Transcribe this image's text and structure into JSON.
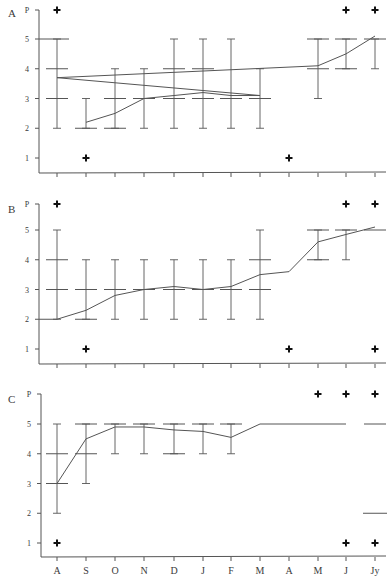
{
  "chart_data": [
    {
      "panel": "A",
      "type": "line",
      "title": "A",
      "ylabel": "",
      "xlabel": "",
      "y_tick_labels": [
        "1",
        "2",
        "3",
        "4",
        "5",
        "P"
      ],
      "categories": [
        "A",
        "S",
        "O",
        "N",
        "D",
        "J",
        "F",
        "M",
        "A",
        "M",
        "J",
        "Jy"
      ],
      "ylim": [
        0.5,
        6
      ],
      "mean_line": [
        {
          "x": "S",
          "y": 2.2
        },
        {
          "x": "O",
          "y": 2.5
        },
        {
          "x": "N",
          "y": 3.0
        },
        {
          "x": "D",
          "y": 3.1
        },
        {
          "x": "J",
          "y": 3.2
        },
        {
          "x": "F",
          "y": 3.1
        },
        {
          "x": "M",
          "y": 3.1
        },
        {
          "x": "A",
          "y": 3.7
        },
        {
          "x": "M",
          "y": 4.1
        },
        {
          "x": "J",
          "y": 4.5
        },
        {
          "x": "Jy",
          "y": 5.1
        }
      ],
      "error_bars": [
        {
          "x": "S",
          "low": 2,
          "high": 3
        },
        {
          "x": "O",
          "low": 2,
          "high": 4
        },
        {
          "x": "N",
          "low": 2,
          "high": 4
        },
        {
          "x": "D",
          "low": 2,
          "high": 5
        },
        {
          "x": "J",
          "low": 2,
          "high": 5
        },
        {
          "x": "F",
          "low": 2,
          "high": 5
        },
        {
          "x": "M",
          "low": 2,
          "high": 4
        },
        {
          "x": "A",
          "low": 2,
          "high": 5
        },
        {
          "x": "M",
          "low": 3,
          "high": 5
        },
        {
          "x": "J",
          "low": 4,
          "high": 5
        },
        {
          "x": "Jy",
          "low": 4,
          "high": 5
        }
      ],
      "quartile_marks": [
        {
          "x": "S",
          "values": [
            2
          ]
        },
        {
          "x": "O",
          "values": [
            2,
            3
          ]
        },
        {
          "x": "N",
          "values": [
            3
          ]
        },
        {
          "x": "D",
          "values": [
            3,
            4
          ]
        },
        {
          "x": "J",
          "values": [
            3,
            4
          ]
        },
        {
          "x": "F",
          "values": [
            3
          ]
        },
        {
          "x": "M",
          "values": [
            3
          ]
        },
        {
          "x": "A",
          "values": [
            3,
            4
          ]
        },
        {
          "x": "M",
          "values": [
            4,
            5
          ]
        },
        {
          "x": "J",
          "values": [
            4,
            5
          ]
        },
        {
          "x": "Jy",
          "values": [
            5
          ]
        }
      ],
      "flat_lines": [
        {
          "from": "axis",
          "to": "A",
          "y": 5
        }
      ],
      "crosses": [
        {
          "x": "A",
          "y": "P"
        },
        {
          "x": "A",
          "y": 1
        },
        {
          "x": "S",
          "y": 1
        },
        {
          "x": "J2",
          "y": "P"
        },
        {
          "x": "Jy",
          "y": "P"
        }
      ]
    },
    {
      "panel": "B",
      "type": "line",
      "title": "B",
      "ylabel": "",
      "xlabel": "",
      "y_tick_labels": [
        "1",
        "2",
        "3",
        "4",
        "5",
        "P"
      ],
      "categories": [
        "A",
        "S",
        "O",
        "N",
        "D",
        "J",
        "F",
        "M",
        "A",
        "M",
        "J",
        "Jy"
      ],
      "ylim": [
        0.5,
        6
      ],
      "mean_line": [
        {
          "x": "axis",
          "y": 2.0
        },
        {
          "x": "A",
          "y": 2.0
        },
        {
          "x": "S",
          "y": 2.3
        },
        {
          "x": "O",
          "y": 2.8
        },
        {
          "x": "N",
          "y": 3.0
        },
        {
          "x": "D",
          "y": 3.1
        },
        {
          "x": "J",
          "y": 3.0
        },
        {
          "x": "F",
          "y": 3.1
        },
        {
          "x": "M",
          "y": 3.5
        },
        {
          "x": "A",
          "y": 3.6
        },
        {
          "x": "M",
          "y": 4.6
        },
        {
          "x": "J",
          "y": 4.85
        },
        {
          "x": "Jy",
          "y": 5.1
        }
      ],
      "error_bars": [
        {
          "x": "S",
          "low": 2,
          "high": 4
        },
        {
          "x": "O",
          "low": 2,
          "high": 4
        },
        {
          "x": "N",
          "low": 2,
          "high": 4
        },
        {
          "x": "D",
          "low": 2,
          "high": 4
        },
        {
          "x": "J",
          "low": 2,
          "high": 4
        },
        {
          "x": "F",
          "low": 2,
          "high": 4
        },
        {
          "x": "M",
          "low": 2,
          "high": 5
        },
        {
          "x": "A",
          "low": 2,
          "high": 5
        },
        {
          "x": "M",
          "low": 4,
          "high": 5
        },
        {
          "x": "J",
          "low": 4,
          "high": 5
        }
      ],
      "quartile_marks": [
        {
          "x": "S",
          "values": [
            2,
            3
          ]
        },
        {
          "x": "O",
          "values": [
            3
          ]
        },
        {
          "x": "N",
          "values": [
            3
          ]
        },
        {
          "x": "D",
          "values": [
            3
          ]
        },
        {
          "x": "J",
          "values": [
            3
          ]
        },
        {
          "x": "F",
          "values": [
            3
          ]
        },
        {
          "x": "M",
          "values": [
            3,
            4
          ]
        },
        {
          "x": "A",
          "values": [
            3,
            4
          ]
        },
        {
          "x": "M",
          "values": [
            4,
            5
          ]
        },
        {
          "x": "J",
          "values": [
            5
          ]
        },
        {
          "x": "Jy",
          "values": [
            5
          ]
        }
      ],
      "crosses": [
        {
          "x": "A",
          "y": "P"
        },
        {
          "x": "A",
          "y": 1
        },
        {
          "x": "S",
          "y": 1
        },
        {
          "x": "J2",
          "y": "P"
        },
        {
          "x": "Jy",
          "y": "P"
        },
        {
          "x": "Jy",
          "y": 1
        }
      ]
    },
    {
      "panel": "C",
      "type": "line",
      "title": "C",
      "ylabel": "",
      "xlabel": "",
      "y_tick_labels": [
        "1",
        "2",
        "3",
        "4",
        "5",
        "P"
      ],
      "categories": [
        "A",
        "S",
        "O",
        "N",
        "D",
        "J",
        "F",
        "M",
        "A",
        "M",
        "J",
        "Jy"
      ],
      "ylim": [
        0.5,
        6
      ],
      "mean_line": [
        {
          "x": "A",
          "y": 3.0
        },
        {
          "x": "S",
          "y": 4.5
        },
        {
          "x": "O",
          "y": 4.9
        },
        {
          "x": "N",
          "y": 4.9
        },
        {
          "x": "D",
          "y": 4.8
        },
        {
          "x": "J",
          "y": 4.75
        },
        {
          "x": "F",
          "y": 4.55
        },
        {
          "x": "M",
          "y": 5.0
        },
        {
          "x": "A",
          "y": 5.0
        },
        {
          "x": "M",
          "y": 5.0
        },
        {
          "x": "J",
          "y": 5.0
        }
      ],
      "error_bars": [
        {
          "x": "A",
          "low": 2,
          "high": 5
        },
        {
          "x": "S",
          "low": 3,
          "high": 5
        },
        {
          "x": "O",
          "low": 4,
          "high": 5
        },
        {
          "x": "N",
          "low": 4,
          "high": 5
        },
        {
          "x": "D",
          "low": 4,
          "high": 5
        },
        {
          "x": "J",
          "low": 4,
          "high": 5
        },
        {
          "x": "F",
          "low": 4,
          "high": 5
        }
      ],
      "quartile_marks": [
        {
          "x": "A",
          "values": [
            3,
            4
          ]
        },
        {
          "x": "S",
          "values": [
            4,
            5
          ]
        },
        {
          "x": "O",
          "values": [
            5
          ]
        },
        {
          "x": "N",
          "values": [
            5
          ]
        },
        {
          "x": "D",
          "values": [
            4,
            5
          ]
        },
        {
          "x": "J",
          "values": [
            5
          ]
        },
        {
          "x": "F",
          "values": [
            5
          ]
        },
        {
          "x": "Jy",
          "values": [
            5
          ]
        }
      ],
      "flat_lines": [
        {
          "from": "Jy",
          "to": "Jy",
          "y": 2
        }
      ],
      "crosses": [
        {
          "x": "A",
          "y": 1
        },
        {
          "x": "M2",
          "y": "P"
        },
        {
          "x": "J2",
          "y": "P"
        },
        {
          "x": "Jy",
          "y": "P"
        },
        {
          "x": "J2",
          "y": 1
        },
        {
          "x": "Jy",
          "y": 1
        }
      ]
    }
  ],
  "layout": {
    "panels": [
      {
        "label": "A",
        "label_x": 8,
        "label_y": 17,
        "axis_x": 39,
        "y_P": 10,
        "y_5": 39,
        "y_1": 158,
        "axis_y": 173
      },
      {
        "label": "B",
        "label_x": 8,
        "label_y": 213,
        "axis_x": 39,
        "y_P": 204,
        "y_5": 230,
        "y_1": 349,
        "axis_y": 364
      },
      {
        "label": "C",
        "label_x": 8,
        "label_y": 403,
        "axis_x": 41,
        "y_P": 394,
        "y_5": 424,
        "y_1": 543,
        "axis_y": 557
      }
    ],
    "x_ticks": [
      57,
      86,
      115,
      144,
      174,
      203,
      231,
      260,
      289,
      318,
      346,
      375
    ],
    "x_axis_end": 386,
    "x_label_y": 574,
    "line_color": "#555555",
    "cross_color": "#111111",
    "text_color": "#3a3a3a"
  }
}
